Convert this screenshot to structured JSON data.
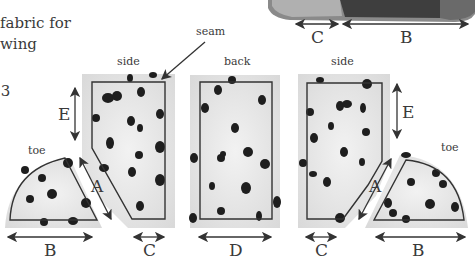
{
  "caption": {
    "line1": "fabric for",
    "line2": "wing",
    "line3": ".3"
  },
  "labels": {
    "seam": "seam",
    "side_left": "side",
    "back": "back",
    "side_right": "side",
    "toe_left": "toe",
    "toe_right": "toe"
  },
  "dimensions": {
    "top_c": "C",
    "top_b": "B",
    "left_e": "E",
    "left_a": "A",
    "left_b": "B",
    "left_c": "C",
    "back_d": "D",
    "right_c": "C",
    "right_a": "A",
    "right_e": "E",
    "right_b": "B"
  },
  "colors": {
    "fabric": "#e6e6e6",
    "spot": "#1e1e1e",
    "outline": "#333333",
    "photo_dark": "#3a3a3a"
  }
}
